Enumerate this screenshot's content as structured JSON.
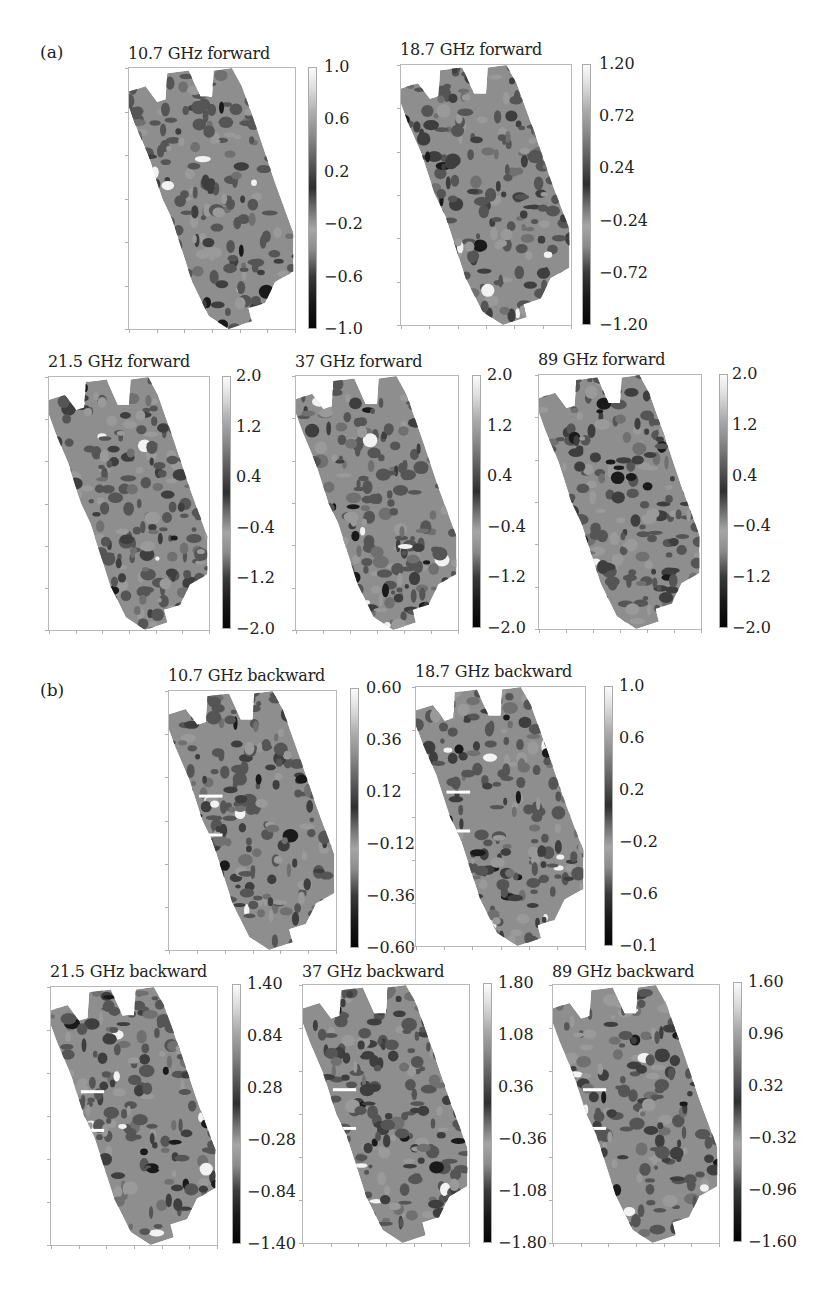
{
  "figure": {
    "part_a_label": "(a)",
    "part_b_label": "(b)"
  },
  "panels": [
    {
      "id": "fwd-10-7",
      "title": "10.7 GHz forward",
      "cbar_ticks": [
        "1.0",
        "0.6",
        "0.2",
        "−0.2",
        "−0.6",
        "−1.0"
      ]
    },
    {
      "id": "fwd-18-7",
      "title": "18.7 GHz forward",
      "cbar_ticks": [
        "1.20",
        "0.72",
        "0.24",
        "−0.24",
        "−0.72",
        "−1.20"
      ]
    },
    {
      "id": "fwd-21-5",
      "title": "21.5 GHz forward",
      "cbar_ticks": [
        "2.0",
        "1.2",
        "0.4",
        "−0.4",
        "−1.2",
        "−2.0"
      ]
    },
    {
      "id": "fwd-37",
      "title": "37 GHz forward",
      "cbar_ticks": [
        "2.0",
        "1.2",
        "0.4",
        "−0.4",
        "−1.2",
        "−2.0"
      ]
    },
    {
      "id": "fwd-89",
      "title": "89 GHz forward",
      "cbar_ticks": [
        "2.0",
        "1.2",
        "0.4",
        "−0.4",
        "−1.2",
        "−2.0"
      ]
    },
    {
      "id": "bwd-10-7",
      "title": "10.7 GHz backward",
      "cbar_ticks": [
        "0.60",
        "0.36",
        "0.12",
        "−0.12",
        "−0.36",
        "−0.60"
      ]
    },
    {
      "id": "bwd-18-7",
      "title": "18.7 GHz backward",
      "cbar_ticks": [
        "1.0",
        "0.6",
        "0.2",
        "−0.2",
        "−0.6",
        "−0.1"
      ]
    },
    {
      "id": "bwd-21-5",
      "title": "21.5 GHz backward",
      "cbar_ticks": [
        "1.40",
        "0.84",
        "0.28",
        "−0.28",
        "−0.84",
        "−1.40"
      ]
    },
    {
      "id": "bwd-37",
      "title": "37 GHz backward",
      "cbar_ticks": [
        "1.80",
        "1.08",
        "0.36",
        "−0.36",
        "−1.08",
        "−1.80"
      ]
    },
    {
      "id": "bwd-89",
      "title": "89 GHz backward",
      "cbar_ticks": [
        "1.60",
        "0.96",
        "0.32",
        "−0.32",
        "−0.96",
        "−1.60"
      ]
    }
  ],
  "chart_data": [
    {
      "type": "heatmap",
      "group": "(a)",
      "title": "10.7 GHz forward",
      "colormap": "grayscale",
      "colorbar_range": [
        -1.0,
        1.0
      ],
      "colorbar_ticks": [
        1.0,
        0.6,
        0.2,
        -0.2,
        -0.6,
        -1.0
      ],
      "xlabel": "",
      "ylabel": "",
      "axis_tick_labels": "none"
    },
    {
      "type": "heatmap",
      "group": "(a)",
      "title": "18.7 GHz forward",
      "colormap": "grayscale",
      "colorbar_range": [
        -1.2,
        1.2
      ],
      "colorbar_ticks": [
        1.2,
        0.72,
        0.24,
        -0.24,
        -0.72,
        -1.2
      ],
      "xlabel": "",
      "ylabel": "",
      "axis_tick_labels": "none"
    },
    {
      "type": "heatmap",
      "group": "(a)",
      "title": "21.5 GHz forward",
      "colormap": "grayscale",
      "colorbar_range": [
        -2.0,
        2.0
      ],
      "colorbar_ticks": [
        2.0,
        1.2,
        0.4,
        -0.4,
        -1.2,
        -2.0
      ],
      "xlabel": "",
      "ylabel": "",
      "axis_tick_labels": "none"
    },
    {
      "type": "heatmap",
      "group": "(a)",
      "title": "37 GHz forward",
      "colormap": "grayscale",
      "colorbar_range": [
        -2.0,
        2.0
      ],
      "colorbar_ticks": [
        2.0,
        1.2,
        0.4,
        -0.4,
        -1.2,
        -2.0
      ],
      "xlabel": "",
      "ylabel": "",
      "axis_tick_labels": "none"
    },
    {
      "type": "heatmap",
      "group": "(a)",
      "title": "89 GHz forward",
      "colormap": "grayscale",
      "colorbar_range": [
        -2.0,
        2.0
      ],
      "colorbar_ticks": [
        2.0,
        1.2,
        0.4,
        -0.4,
        -1.2,
        -2.0
      ],
      "xlabel": "",
      "ylabel": "",
      "axis_tick_labels": "none"
    },
    {
      "type": "heatmap",
      "group": "(b)",
      "title": "10.7 GHz backward",
      "colormap": "grayscale",
      "colorbar_range": [
        -0.6,
        0.6
      ],
      "colorbar_ticks": [
        0.6,
        0.36,
        0.12,
        -0.12,
        -0.36,
        -0.6
      ],
      "xlabel": "",
      "ylabel": "",
      "axis_tick_labels": "none"
    },
    {
      "type": "heatmap",
      "group": "(b)",
      "title": "18.7 GHz backward",
      "colormap": "grayscale",
      "colorbar_range": [
        -1.0,
        1.0
      ],
      "colorbar_ticks": [
        1.0,
        0.6,
        0.2,
        -0.2,
        -0.6,
        -0.1
      ],
      "xlabel": "",
      "ylabel": "",
      "axis_tick_labels": "none"
    },
    {
      "type": "heatmap",
      "group": "(b)",
      "title": "21.5 GHz backward",
      "colormap": "grayscale",
      "colorbar_range": [
        -1.4,
        1.4
      ],
      "colorbar_ticks": [
        1.4,
        0.84,
        0.28,
        -0.28,
        -0.84,
        -1.4
      ],
      "xlabel": "",
      "ylabel": "",
      "axis_tick_labels": "none"
    },
    {
      "type": "heatmap",
      "group": "(b)",
      "title": "37 GHz backward",
      "colormap": "grayscale",
      "colorbar_range": [
        -1.8,
        1.8
      ],
      "colorbar_ticks": [
        1.8,
        1.08,
        0.36,
        -0.36,
        -1.08,
        -1.8
      ],
      "xlabel": "",
      "ylabel": "",
      "axis_tick_labels": "none"
    },
    {
      "type": "heatmap",
      "group": "(b)",
      "title": "89 GHz backward",
      "colormap": "grayscale",
      "colorbar_range": [
        -1.6,
        1.6
      ],
      "colorbar_ticks": [
        1.6,
        0.96,
        0.32,
        -0.32,
        -0.96,
        -1.6
      ],
      "xlabel": "",
      "ylabel": "",
      "axis_tick_labels": "none"
    }
  ]
}
